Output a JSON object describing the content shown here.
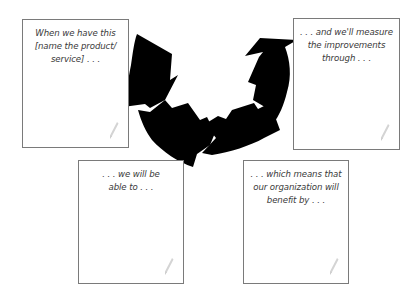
{
  "diagram": {
    "type": "cycle-with-note-cards",
    "colors": {
      "arrow": "#000000",
      "card_border": "#7a7a7a",
      "text": "#3a3a3a",
      "pencil": "#cfcfcf",
      "background": "#ffffff"
    },
    "cards": [
      {
        "id": "card-1",
        "position": "top-left",
        "lines": [
          "When we have this",
          "[name the product/",
          "service] . . ."
        ],
        "icon": "pencil-icon"
      },
      {
        "id": "card-2",
        "position": "top-right",
        "lines": [
          ". . . and we'll measure",
          "the improvements",
          "through . . ."
        ],
        "icon": "pencil-icon"
      },
      {
        "id": "card-3",
        "position": "bottom-left",
        "lines": [
          ". . . we will be",
          "able to . . ."
        ],
        "icon": "pencil-icon"
      },
      {
        "id": "card-4",
        "position": "bottom-right",
        "lines": [
          ". . . which means that",
          "our organization will",
          "benefit by . . ."
        ],
        "icon": "pencil-icon"
      }
    ],
    "arrows": [
      {
        "name": "arrow-1",
        "direction": "down-right",
        "from": "card-1",
        "to": "card-3"
      },
      {
        "name": "arrow-2",
        "direction": "right",
        "from": "card-3",
        "to": "card-4"
      },
      {
        "name": "arrow-3",
        "direction": "right-up",
        "from": "card-4",
        "to": "card-2"
      },
      {
        "name": "arrow-4",
        "direction": "up-right",
        "from": "card-4",
        "to": "card-2"
      }
    ]
  }
}
